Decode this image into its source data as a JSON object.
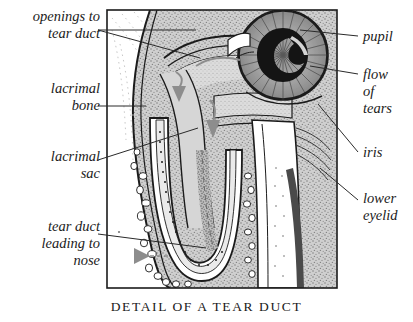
{
  "figure": {
    "caption": "DETAIL OF A TEAR DUCT",
    "frame": {
      "x": 107,
      "y": 10,
      "width": 230,
      "height": 278
    },
    "colors": {
      "ink": "#1b1b1b",
      "background": "#ffffff",
      "bone_stipple": "#b9b9b9",
      "tissue_light": "#d9d9d9",
      "tissue_mid": "#c2c2c2",
      "duct_lumen": "#f2f2f2",
      "pupil": "#151515",
      "iris": "#9a9a9a",
      "flow_arrow": "#8d8d8d",
      "leader_line": "#2a2a2a"
    }
  },
  "labels_left": [
    {
      "id": "openings-to-tear-duct",
      "text": "openings to\ntear duct",
      "x": 4,
      "y": 8,
      "width": 96
    },
    {
      "id": "lacrimal-bone",
      "text": "lacrimal\nbone",
      "x": 4,
      "y": 80,
      "width": 96
    },
    {
      "id": "lacrimal-sac",
      "text": "lacrimal\nsac",
      "x": 4,
      "y": 148,
      "width": 96
    },
    {
      "id": "tear-duct-leading-to-nose",
      "text": "tear duct\nleading to\nnose",
      "x": 4,
      "y": 218,
      "width": 96
    }
  ],
  "labels_right": [
    {
      "id": "pupil",
      "text": "pupil",
      "x": 363,
      "y": 30,
      "width": 48
    },
    {
      "id": "flow-of-tears",
      "text": "flow\nof\ntears",
      "x": 363,
      "y": 68,
      "width": 48
    },
    {
      "id": "iris",
      "text": "iris",
      "x": 363,
      "y": 148,
      "width": 48
    },
    {
      "id": "lower-eyelid",
      "text": "lower\neyelid",
      "x": 363,
      "y": 194,
      "width": 48
    }
  ],
  "anatomy_parts": [
    {
      "name": "pupil",
      "description": "dark crescent-shaped opening at centre of iris"
    },
    {
      "name": "iris",
      "description": "radially striated circular disc of the eye"
    },
    {
      "name": "lower-eyelid",
      "description": "eyelid margin with lashes below the eye"
    },
    {
      "name": "lacrimal-bone",
      "description": "stippled bone forming the wall of the tear duct"
    },
    {
      "name": "lacrimal-sac",
      "description": "widened reservoir at the top of the tear duct"
    },
    {
      "name": "tear-duct",
      "description": "U-shaped nasolacrimal channel leading to the nose"
    },
    {
      "name": "openings-to-tear-duct",
      "description": "puncta at the inner corner of the eyelids"
    }
  ],
  "flow_arrows": [
    {
      "id": "flow-arrow-upper",
      "direction": "down",
      "note": "tears entering the lacrimal sac"
    },
    {
      "id": "flow-arrow-mid",
      "direction": "down",
      "note": "tears descending the duct"
    },
    {
      "id": "flow-arrow-lower",
      "direction": "down",
      "note": "tears in the lower duct"
    },
    {
      "id": "flow-arrow-nose",
      "direction": "left",
      "note": "tears exiting toward the nose"
    }
  ]
}
